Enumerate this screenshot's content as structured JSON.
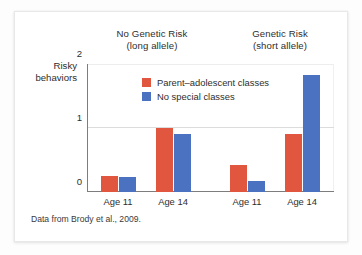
{
  "figure": {
    "source_note": "Data from Brody et al., 2009.",
    "y_axis_label_line1": "Risky",
    "y_axis_label_line2": "behaviors",
    "group_headings": [
      {
        "line1": "No Genetic Risk",
        "line2": "(long allele)"
      },
      {
        "line1": "Genetic Risk",
        "line2": "(short allele)"
      }
    ],
    "colors": {
      "series_a": "#e0563f",
      "series_b": "#4a72c0",
      "axis": "#7d7d7d",
      "gridline": "#dcdcdc",
      "card_background": "#ffffff",
      "page_background": "#fdfdfd"
    }
  },
  "chart_data": {
    "type": "bar",
    "title": "",
    "xlabel": "",
    "ylabel": "Risky behaviors",
    "ylim": [
      0,
      2
    ],
    "yticks": [
      "0",
      "1",
      "2"
    ],
    "ytick_values": [
      0,
      1,
      2
    ],
    "grid": true,
    "legend_position": "inside-top-center",
    "groups": [
      "No Genetic Risk (long allele)",
      "Genetic Risk (short allele)"
    ],
    "categories": [
      "Age 11",
      "Age 14",
      "Age 11",
      "Age 14"
    ],
    "series": [
      {
        "name": "Parent–adolescent classes",
        "color": "#e0563f",
        "values": [
          0.25,
          1.0,
          0.42,
          0.9
        ]
      },
      {
        "name": "No special classes",
        "color": "#4a72c0",
        "values": [
          0.23,
          0.9,
          0.17,
          1.83
        ]
      }
    ],
    "annotations": [
      "Data from Brody et al., 2009."
    ]
  },
  "layout": {
    "bar_width_px": 17,
    "pair_gap_px": 1,
    "group_centers_px": [
      31,
      86,
      160,
      215
    ]
  }
}
